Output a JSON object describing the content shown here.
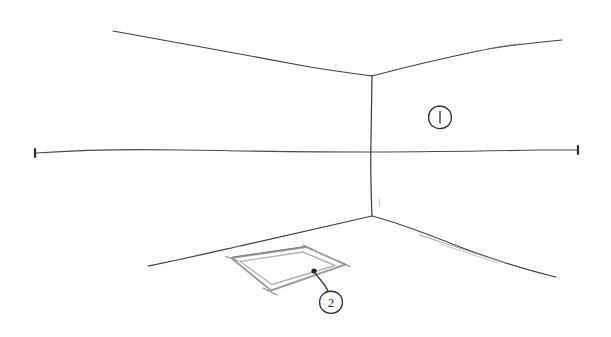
{
  "drawing": {
    "title": "Interior room corner perspective sketch",
    "medium": "pencil-on-paper",
    "background_color": "#ffffff",
    "line_color": "#3a3a3a",
    "faint_line_color": "#8a8a8a",
    "object_line_color": "#a8a8a8"
  },
  "scene": {
    "type": "two-point-ish interior corner",
    "elements": [
      {
        "name": "ceiling-line-left",
        "description": "ceiling edge receding from upper-left to corner"
      },
      {
        "name": "ceiling-line-right",
        "description": "ceiling edge receding from corner to upper-right"
      },
      {
        "name": "wall-corner-line",
        "description": "vertical inner corner where two walls meet"
      },
      {
        "name": "horizon-line",
        "description": "long horizontal eye-level line crossing full width"
      },
      {
        "name": "floor-line-left",
        "description": "floor edge of left wall"
      },
      {
        "name": "floor-line-right",
        "description": "floor edge of right wall"
      },
      {
        "name": "floor-frame-object",
        "description": "flat rectangular frame / mat lying on the floor in perspective"
      }
    ]
  },
  "callouts": [
    {
      "id": "callout-1",
      "label": "1",
      "target": "right wall surface",
      "cx": 440,
      "cy": 117,
      "r": 11,
      "has_leader": false
    },
    {
      "id": "callout-2",
      "label": "2",
      "target": "rectangular frame on floor",
      "cx": 331,
      "cy": 302,
      "r": 11,
      "has_leader": true,
      "leader_anchor_x": 314,
      "leader_anchor_y": 271
    }
  ],
  "horizon": {
    "left_end_x": 35,
    "left_end_y": 153,
    "right_end_x": 578,
    "right_end_y": 150,
    "has_end_dots": true
  }
}
